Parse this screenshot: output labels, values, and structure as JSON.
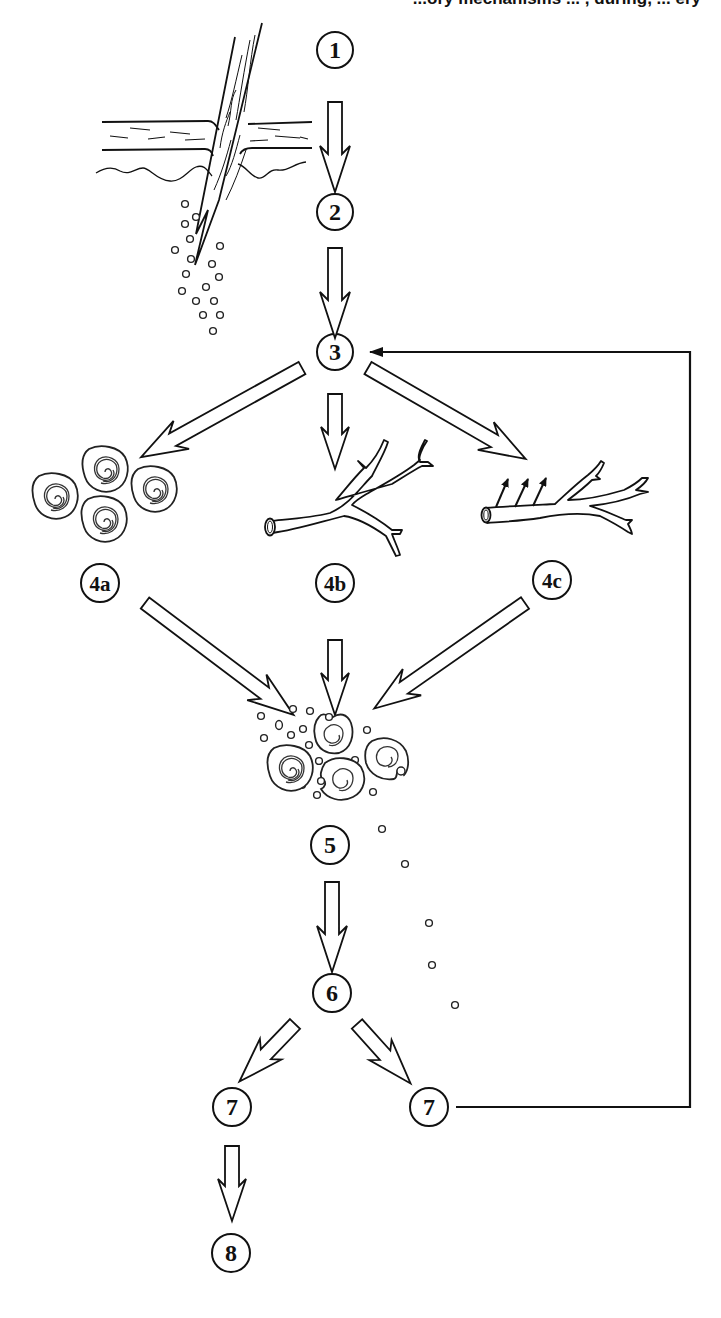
{
  "header_fragment": "...ory mechanisms ... , during, ... ery",
  "colors": {
    "ink": "#111111",
    "background": "#ffffff"
  },
  "steps": {
    "s1": "1",
    "s2": "2",
    "s3": "3",
    "s4a": "4a",
    "s4b": "4b",
    "s4c": "4c",
    "s5": "5",
    "s6": "6",
    "s7_left": "7",
    "s7_right": "7",
    "s8": "8"
  },
  "illustrations": [
    {
      "name": "splinter-penetrating-skin-icon",
      "near_step": "1-2"
    },
    {
      "name": "bacteria-dots-icon",
      "near_step": "2"
    },
    {
      "name": "leukocytes-cluster-icon",
      "near_step": "4a"
    },
    {
      "name": "dilated-blood-vessel-icon",
      "near_step": "4b"
    },
    {
      "name": "permeable-blood-vessel-icon",
      "near_step": "4c"
    },
    {
      "name": "phagocytosis-cluster-icon",
      "near_step": "5"
    }
  ],
  "connections": [
    [
      "1",
      "2"
    ],
    [
      "2",
      "3"
    ],
    [
      "3",
      "4a"
    ],
    [
      "3",
      "4b"
    ],
    [
      "3",
      "4c"
    ],
    [
      "4a",
      "5"
    ],
    [
      "4b",
      "5"
    ],
    [
      "4c",
      "5"
    ],
    [
      "5",
      "6"
    ],
    [
      "6",
      "7_left"
    ],
    [
      "6",
      "7_right"
    ],
    [
      "7_left",
      "8"
    ],
    [
      "7_right",
      "3"
    ]
  ]
}
